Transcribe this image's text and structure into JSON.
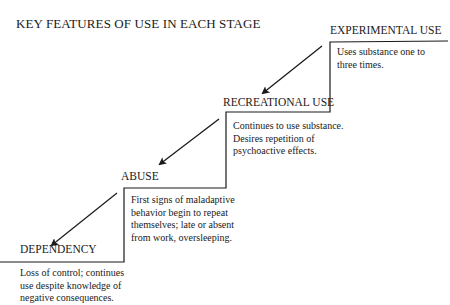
{
  "title": "KEY FEATURES OF USE IN EACH STAGE",
  "stages": [
    {
      "name": "EXPERIMENTAL USE",
      "description": "Uses substance one to three times."
    },
    {
      "name": "RECREATIONAL USE",
      "description": "Continues to use substance. Desires repetition of psychoactive effects."
    },
    {
      "name": "ABUSE",
      "description": "First signs of maladaptive behavior begin to repeat themselves; late or absent from work, oversleeping."
    },
    {
      "name": "DEPENDENCY",
      "description": "Loss of control; continues use despite knowledge of negative consequences."
    }
  ],
  "colors": {
    "ink": "#1a1a1a",
    "background": "#ffffff"
  }
}
